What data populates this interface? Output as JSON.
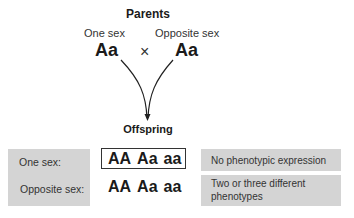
{
  "parents": {
    "title": "Parents",
    "left_label": "One sex",
    "right_label": "Opposite sex",
    "left_genotype": "Aa",
    "right_genotype": "Aa",
    "cross_symbol": "×"
  },
  "offspring": {
    "title": "Offspring",
    "rows": [
      {
        "label": "One sex:",
        "genotypes": [
          "AA",
          "Aa",
          "aa"
        ],
        "boxed": true,
        "result": "No phenotypic expression"
      },
      {
        "label": "Opposite sex:",
        "genotypes": [
          "AA",
          "Aa",
          "aa"
        ],
        "boxed": false,
        "result": "Two or three different phenotypes"
      }
    ]
  },
  "colors": {
    "box_fill": "#d4d4d4",
    "text": "#1a1a1a",
    "line": "#222222"
  }
}
